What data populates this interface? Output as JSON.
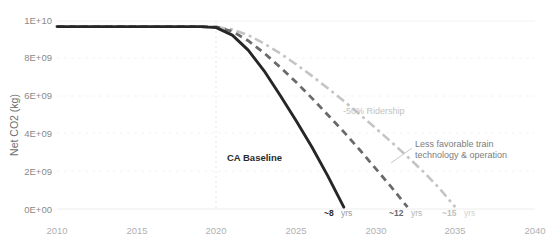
{
  "chart_data": {
    "type": "line",
    "title": "",
    "xlabel": "",
    "ylabel": "Net CO2 (kg)",
    "xlim": [
      2010,
      2040
    ],
    "ylim": [
      0,
      10000000000
    ],
    "grid": true,
    "legend_position": "inline-annotations",
    "xticks": [
      "2010",
      "2015",
      "2020",
      "2025",
      "2030",
      "2035",
      "2040"
    ],
    "xtick_values": [
      2010,
      2015,
      2020,
      2025,
      2030,
      2035,
      2040
    ],
    "yticks": [
      "0E+00",
      "2E+09",
      "4E+09",
      "6E+09",
      "8E+09",
      "1E+10"
    ],
    "ytick_values": [
      0,
      2000000000,
      4000000000,
      6000000000,
      8000000000,
      10000000000
    ],
    "series": [
      {
        "name": "CA Baseline",
        "style": "solid",
        "color": "#262626",
        "annotation": "~8",
        "annotation_unit": "yrs",
        "x": [
          2010,
          2012,
          2014,
          2016,
          2018,
          2019,
          2020,
          2021,
          2022,
          2023,
          2024,
          2025,
          2026,
          2027,
          2028
        ],
        "values": [
          9700000000,
          9700000000,
          9700000000,
          9700000000,
          9700000000,
          9700000000,
          9650000000,
          9250000000,
          8450000000,
          7350000000,
          6050000000,
          4700000000,
          3300000000,
          1750000000,
          100000000
        ]
      },
      {
        "name": "Less favorable train technology & operation",
        "style": "dashed",
        "color": "#6a6a6a",
        "annotation": "~12",
        "annotation_unit": "yrs",
        "x": [
          2010,
          2012,
          2014,
          2016,
          2018,
          2019,
          2020,
          2021,
          2022,
          2023,
          2024,
          2025,
          2026,
          2027,
          2028,
          2029,
          2030,
          2031,
          2032
        ],
        "values": [
          9700000000,
          9700000000,
          9700000000,
          9700000000,
          9700000000,
          9700000000,
          9680000000,
          9450000000,
          8950000000,
          8300000000,
          7550000000,
          6750000000,
          5900000000,
          5000000000,
          4100000000,
          3150000000,
          2150000000,
          1150000000,
          100000000
        ]
      },
      {
        "name": "-50% Ridership",
        "style": "dash-dot",
        "color": "#c4c4c4",
        "annotation": "~15",
        "annotation_unit": "yrs",
        "x": [
          2010,
          2012,
          2014,
          2016,
          2018,
          2019,
          2020,
          2021,
          2022,
          2023,
          2024,
          2025,
          2026,
          2027,
          2028,
          2029,
          2030,
          2031,
          2032,
          2033,
          2034,
          2035
        ],
        "values": [
          9700000000,
          9700000000,
          9700000000,
          9700000000,
          9700000000,
          9700000000,
          9690000000,
          9550000000,
          9250000000,
          8800000000,
          8280000000,
          7700000000,
          7080000000,
          6420000000,
          5740000000,
          5030000000,
          4300000000,
          3550000000,
          2780000000,
          1980000000,
          1100000000,
          100000000
        ]
      }
    ],
    "annotations": [
      {
        "id": "ca-baseline",
        "text": "CA Baseline",
        "tone": "dark"
      },
      {
        "id": "ridership",
        "text": "-50% Ridership",
        "tone": "light"
      },
      {
        "id": "tech-line1",
        "text": "Less favorable train",
        "tone": "mid"
      },
      {
        "id": "tech-line2",
        "text": "technology & operation",
        "tone": "mid"
      }
    ],
    "colors": {
      "baseline": "#262626",
      "tech": "#6a6a6a",
      "ridership": "#c4c4c4",
      "grid": "#f0f0f0",
      "tick_label": "#b0b0b0",
      "axis_title": "#6e6e6e"
    }
  }
}
